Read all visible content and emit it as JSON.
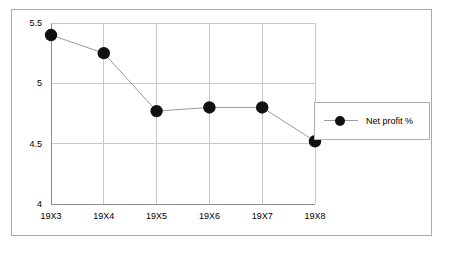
{
  "chart_data": {
    "type": "line",
    "title": "",
    "xlabel": "",
    "ylabel": "",
    "categories": [
      "19X3",
      "19X4",
      "19X5",
      "19X6",
      "19X7",
      "19X8"
    ],
    "series": [
      {
        "name": "Net profit %",
        "values": [
          5.4,
          5.25,
          4.77,
          4.8,
          4.8,
          4.52
        ],
        "marker": "filled-circle",
        "marker_color": "#111111",
        "line_color": "#9a9a9a"
      }
    ],
    "ylim": [
      4,
      5.5
    ],
    "ytick_labels": [
      "5.5",
      "5",
      "4.5",
      "4"
    ],
    "ytick_values": [
      5.5,
      5,
      4.5,
      4
    ],
    "grid": true,
    "grid_color": "#c8c8c8",
    "legend_position": "right",
    "legend_entries": [
      "Net profit %"
    ],
    "plot_border_color": "#a9a9a9",
    "frame_border_color": "#a9a9a9",
    "background": "#ffffff"
  },
  "legend": {
    "entry_label": "Net profit %"
  }
}
